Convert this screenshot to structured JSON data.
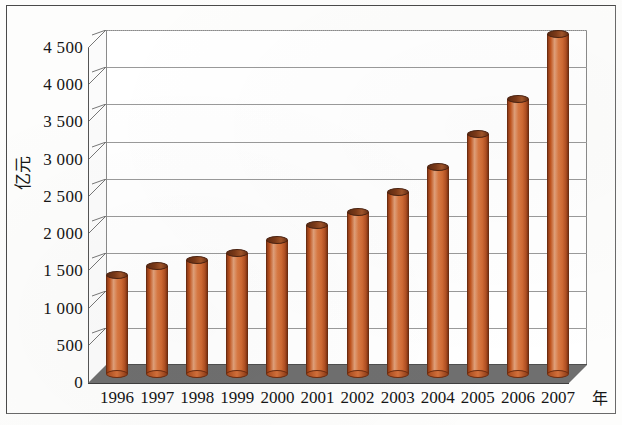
{
  "chart_data": {
    "type": "bar",
    "title": "",
    "subtitle": "",
    "xlabel": "年",
    "ylabel": "亿元",
    "categories": [
      "1996",
      "1997",
      "1998",
      "1999",
      "2000",
      "2001",
      "2002",
      "2003",
      "2004",
      "2005",
      "2006",
      "2007"
    ],
    "values": [
      1330,
      1450,
      1530,
      1630,
      1800,
      2000,
      2180,
      2450,
      2780,
      3220,
      3700,
      4570
    ],
    "series": [
      {
        "name": "亿元",
        "values": [
          1330,
          1450,
          1530,
          1630,
          1800,
          2000,
          2180,
          2450,
          2780,
          3220,
          3700,
          4570
        ]
      }
    ],
    "ylim": [
      0,
      4500
    ],
    "yticks": [
      0,
      500,
      1000,
      1500,
      2000,
      2500,
      3000,
      3500,
      4000,
      4500
    ],
    "ytick_labels": [
      "0",
      "500",
      "1 000",
      "1 500",
      "2 000",
      "2 500",
      "3 000",
      "3 500",
      "4 000",
      "4 500"
    ],
    "xtick_labels": [
      "1996",
      "1997",
      "1998",
      "1999",
      "2000",
      "2001",
      "2002",
      "2003",
      "2004",
      "2005",
      "2006",
      "2007"
    ],
    "grid": true,
    "grid_axis": "y",
    "legend": false,
    "legend_position": "none",
    "style": "3d-cylinder",
    "bar_color": "#d2622f",
    "bar_edge_color": "#6e2d10",
    "floor_color": "#6f6f6f",
    "grid_color": "#9a9a9a",
    "background_color": "#ffffff",
    "annotations": []
  },
  "axis": {
    "y_title": "亿元",
    "x_title": "年"
  }
}
